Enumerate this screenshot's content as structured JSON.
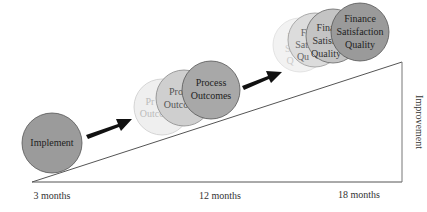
{
  "diagram": {
    "stages": [
      {
        "id": "implement",
        "lines": [
          "Implement"
        ],
        "fill": "#9b9b9b"
      },
      {
        "id": "process",
        "lines": [
          "Process",
          "Outcomes"
        ],
        "fill": "#a8a8a8",
        "ghost_lines_1": [
          "Pro",
          "Outco"
        ],
        "ghost_lines_2": [
          "Pr",
          "Outco"
        ]
      },
      {
        "id": "finance",
        "lines": [
          "Finance",
          "Satisfaction",
          "Quality"
        ],
        "fill": "#9a9a9a",
        "ghost_lines_1": [
          "Finan",
          "Satisfa",
          "Quality"
        ],
        "ghost_lines_2": [
          "Fi",
          "Sati",
          "Qu"
        ],
        "ghost_lines_3": [
          "F",
          "Sa",
          "Q"
        ]
      }
    ],
    "x_labels": [
      "3 months",
      "12 months",
      "18 months"
    ],
    "y_label": "Improvement",
    "colors": {
      "arrow": "#111111",
      "line": "#555555",
      "ghost_fill": "#e6e6e6"
    }
  }
}
